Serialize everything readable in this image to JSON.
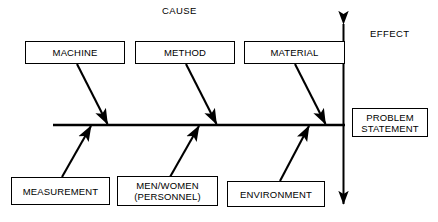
{
  "diagram": {
    "type": "fishbone-ishikawa",
    "labels": {
      "cause": "CAUSE",
      "effect": "EFFECT"
    },
    "effect_box": {
      "line1": "PROBLEM",
      "line2": "STATEMENT"
    },
    "top_causes": [
      {
        "label": "MACHINE"
      },
      {
        "label": "METHOD"
      },
      {
        "label": "MATERIAL"
      }
    ],
    "bottom_causes": [
      {
        "label": "MEASUREMENT",
        "line2": ""
      },
      {
        "label": "MEN/WOMEN",
        "line2": "(PERSONNEL)"
      },
      {
        "label": "ENVIRONMENT",
        "line2": ""
      }
    ],
    "colors": {
      "stroke": "#000000",
      "background": "#ffffff",
      "text": "#000000"
    }
  }
}
